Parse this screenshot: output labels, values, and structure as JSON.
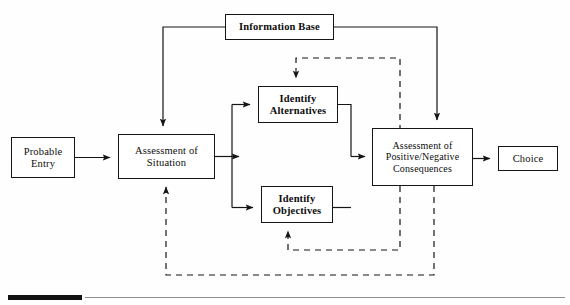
{
  "figure": {
    "type": "flowchart",
    "nodes": [
      {
        "id": "probable_entry",
        "label": "Probable\nEntry"
      },
      {
        "id": "assessment_situation",
        "label": "Assessment of\nSituation"
      },
      {
        "id": "identify_alternatives",
        "label": "Identify\nAlternatives"
      },
      {
        "id": "identify_objectives",
        "label": "Identify\nObjectives"
      },
      {
        "id": "assessment_consequences",
        "label": "Assessment of\nPositive/Negative\nConsequences"
      },
      {
        "id": "choice",
        "label": "Choice"
      },
      {
        "id": "information_base",
        "label": "Information Base"
      }
    ],
    "edges": [
      {
        "from": "probable_entry",
        "to": "assessment_situation",
        "style": "solid",
        "arrow": true
      },
      {
        "from": "assessment_situation",
        "to": "identify_alternatives",
        "style": "solid",
        "arrow": true
      },
      {
        "from": "assessment_situation",
        "to": "identify_objectives",
        "style": "solid",
        "arrow": true
      },
      {
        "from": "identify_alternatives",
        "to": "assessment_consequences",
        "style": "solid",
        "arrow": true
      },
      {
        "from": "identify_objectives",
        "to": "assessment_consequences",
        "style": "solid",
        "arrow": true
      },
      {
        "from": "assessment_consequences",
        "to": "choice",
        "style": "solid",
        "arrow": true
      },
      {
        "from": "information_base",
        "to": "assessment_situation",
        "style": "solid",
        "arrow": true
      },
      {
        "from": "information_base",
        "to": "assessment_consequences",
        "style": "solid",
        "arrow": true
      },
      {
        "from": "assessment_consequences",
        "to": "identify_alternatives",
        "style": "dashed",
        "arrow": true
      },
      {
        "from": "assessment_consequences",
        "to": "identify_objectives",
        "style": "dashed",
        "arrow": true
      },
      {
        "from": "assessment_consequences",
        "to": "assessment_situation",
        "style": "dashed",
        "arrow": true
      }
    ],
    "colors": {
      "stroke": "#151515",
      "box_fill": "#ffffff",
      "text": "#0d0d0d",
      "footer_rule": "#8e8e8e",
      "footer_bar": "#121212"
    }
  }
}
